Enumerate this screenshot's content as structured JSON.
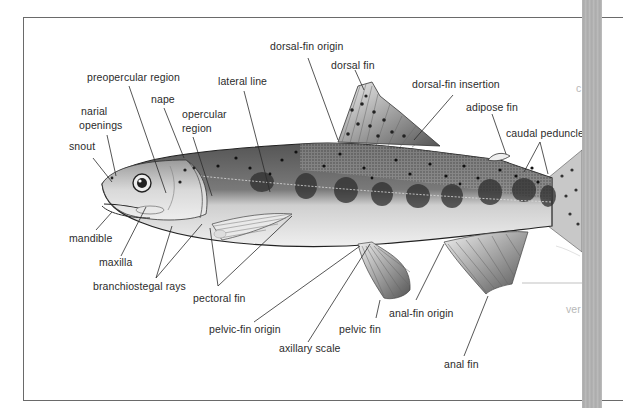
{
  "diagram": {
    "labels": {
      "dorsal_fin_origin": "dorsal-fin origin",
      "dorsal_fin": "dorsal fin",
      "dorsal_fin_insertion": "dorsal-fin insertion",
      "adipose_fin": "adipose fin",
      "caudal_peduncle": "caudal peduncle",
      "preopercular_region": "preopercular region",
      "lateral_line": "lateral line",
      "nape": "nape",
      "opercular_region_1": "opercular",
      "opercular_region_2": "region",
      "narial_openings_1": "narial",
      "narial_openings_2": "openings",
      "snout": "snout",
      "mandible": "mandible",
      "maxilla": "maxilla",
      "branchiostegal_rays": "branchiostegal rays",
      "pectoral_fin": "pectoral fin",
      "pelvic_fin_origin": "pelvic-fin origin",
      "axillary_scale": "axillary scale",
      "pelvic_fin": "pelvic fin",
      "anal_fin_origin": "anal-fin origin",
      "anal_fin": "anal fin",
      "cut_off_right_top": "c",
      "cut_off_right_bottom": "ver"
    },
    "colors": {
      "text": "#2b2b2b",
      "line": "#333333",
      "body_dark": "#4a4a4a",
      "belly": "#e6e6e6",
      "frame": "#6a6a6a",
      "gutter": "#b0b0b0"
    }
  }
}
